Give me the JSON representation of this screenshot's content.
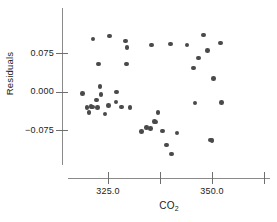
{
  "chart_data": {
    "type": "scatter",
    "title": "",
    "xlabel": "CO2",
    "xlabel_display": "CO",
    "xlabel_sub": "2",
    "ylabel": "Residuals",
    "xtick_labels": [
      "325.0",
      "350.0"
    ],
    "xticks": [
      325.0,
      337.5,
      350.0,
      362.5
    ],
    "xticks_labeled": [
      325.0,
      350.0
    ],
    "ytick_labels": [
      "0.075",
      "0.000",
      "−0.075"
    ],
    "yticks": [
      0.075,
      0.0,
      -0.075
    ],
    "xlim": [
      316.5,
      363.5
    ],
    "ylim": [
      -0.122,
      0.112
    ],
    "grid": false,
    "legend": false,
    "marker_color": "#4a4a4a",
    "axis_color": "#8a8a8a",
    "background": "#ffffff",
    "n_points": 44,
    "points": [
      {
        "x": 318.9,
        "y": -0.004
      },
      {
        "x": 320.0,
        "y": -0.031
      },
      {
        "x": 320.4,
        "y": -0.041
      },
      {
        "x": 320.9,
        "y": -0.029
      },
      {
        "x": 321.3,
        "y": -0.03
      },
      {
        "x": 321.4,
        "y": 0.102
      },
      {
        "x": 322.2,
        "y": -0.017
      },
      {
        "x": 322.5,
        "y": -0.031
      },
      {
        "x": 322.7,
        "y": 0.054
      },
      {
        "x": 323.1,
        "y": 0.01
      },
      {
        "x": 323.3,
        "y": -0.006
      },
      {
        "x": 324.3,
        "y": -0.044
      },
      {
        "x": 325.1,
        "y": -0.027
      },
      {
        "x": 325.4,
        "y": 0.108
      },
      {
        "x": 326.9,
        "y": -0.02
      },
      {
        "x": 327.0,
        "y": -0.001
      },
      {
        "x": 328.2,
        "y": -0.03
      },
      {
        "x": 329.2,
        "y": 0.098
      },
      {
        "x": 329.5,
        "y": 0.054
      },
      {
        "x": 329.6,
        "y": 0.086
      },
      {
        "x": 330.3,
        "y": -0.031
      },
      {
        "x": 333.0,
        "y": -0.078
      },
      {
        "x": 334.3,
        "y": -0.07
      },
      {
        "x": 335.2,
        "y": -0.072
      },
      {
        "x": 335.4,
        "y": 0.091
      },
      {
        "x": 336.2,
        "y": -0.058
      },
      {
        "x": 337.0,
        "y": -0.041
      },
      {
        "x": 338.1,
        "y": -0.077
      },
      {
        "x": 339.1,
        "y": -0.104
      },
      {
        "x": 340.0,
        "y": 0.093
      },
      {
        "x": 340.3,
        "y": -0.122
      },
      {
        "x": 341.6,
        "y": -0.081
      },
      {
        "x": 344.0,
        "y": 0.091
      },
      {
        "x": 345.6,
        "y": 0.046
      },
      {
        "x": 345.9,
        "y": -0.022
      },
      {
        "x": 346.8,
        "y": 0.065
      },
      {
        "x": 348.0,
        "y": 0.11
      },
      {
        "x": 348.9,
        "y": 0.08
      },
      {
        "x": 349.6,
        "y": -0.094
      },
      {
        "x": 350.0,
        "y": -0.095
      },
      {
        "x": 350.4,
        "y": 0.025
      },
      {
        "x": 352.0,
        "y": 0.094
      },
      {
        "x": 352.3,
        "y": -0.021
      },
      {
        "x": 336.4,
        "y": -0.059
      }
    ]
  }
}
